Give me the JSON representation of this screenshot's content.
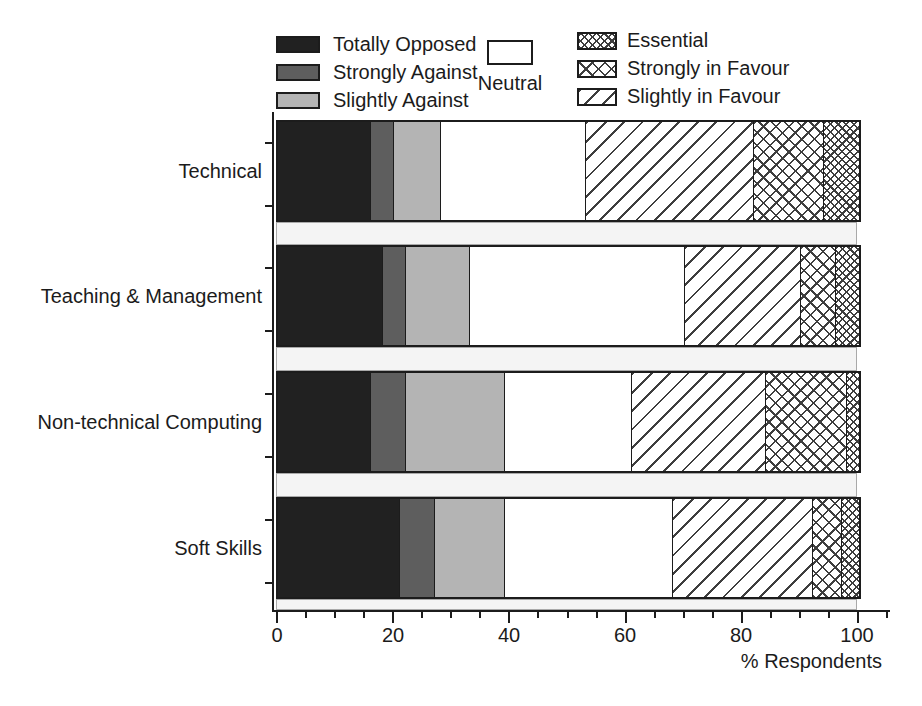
{
  "figure": {
    "x_axis": {
      "ticks": [
        "0",
        "20",
        "40",
        "60",
        "80",
        "100"
      ],
      "label": "% Respondents"
    }
  },
  "chart_data": {
    "type": "bar",
    "orientation": "horizontal",
    "stacked": true,
    "title": "",
    "xlabel": "% Respondents",
    "ylabel": "",
    "xlim": [
      0,
      100
    ],
    "xticks_major": [
      0,
      20,
      40,
      60,
      80,
      100
    ],
    "xticks_minor_step": 5,
    "grid": false,
    "legend_position": "top",
    "categories": [
      "Technical",
      "Teaching & Management",
      "Non-technical Computing",
      "Soft Skills"
    ],
    "series": [
      {
        "name": "Totally Opposed",
        "pattern": "solid-black",
        "color": "#212121",
        "values": [
          16,
          18,
          16,
          21
        ]
      },
      {
        "name": "Strongly Against",
        "pattern": "solid-dark-gray",
        "color": "#5e5e5e",
        "values": [
          4,
          4,
          6,
          6
        ]
      },
      {
        "name": "Slightly Against",
        "pattern": "solid-light-gray",
        "color": "#b4b4b4",
        "values": [
          8,
          11,
          17,
          12
        ]
      },
      {
        "name": "Neutral",
        "pattern": "solid-white",
        "color": "#ffffff",
        "values": [
          25,
          37,
          22,
          29
        ]
      },
      {
        "name": "Slightly in Favour",
        "pattern": "diagonal-stripes",
        "color": "#ffffff",
        "values": [
          29,
          20,
          23,
          24
        ]
      },
      {
        "name": "Strongly in Favour",
        "pattern": "open-crosshatch",
        "color": "#ffffff",
        "values": [
          12,
          6,
          14,
          5
        ]
      },
      {
        "name": "Essential",
        "pattern": "dense-crosshatch",
        "color": "#ffffff",
        "values": [
          6,
          4,
          2,
          3
        ]
      }
    ],
    "legend_layout": {
      "left_column": [
        "Totally Opposed",
        "Strongly Against",
        "Slightly Against"
      ],
      "center": [
        "Neutral"
      ],
      "right_column": [
        "Essential",
        "Strongly in Favour",
        "Slightly in Favour"
      ]
    }
  }
}
